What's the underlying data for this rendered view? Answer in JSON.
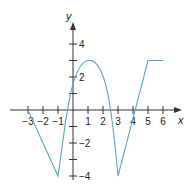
{
  "chart_data": {
    "type": "line",
    "title": "",
    "xlabel": "x",
    "ylabel": "y",
    "xlim": [
      -3.5,
      6.5
    ],
    "ylim": [
      -4.5,
      5
    ],
    "grid": false,
    "x_ticks": [
      -3,
      -2,
      -1,
      1,
      2,
      3,
      4,
      5,
      6
    ],
    "x_tick_labels": [
      "−3",
      "−2",
      "−1",
      "1",
      "2",
      "3",
      "4",
      "5",
      "6"
    ],
    "y_ticks": [
      -4,
      -3,
      -2,
      -1,
      1,
      2,
      3,
      4
    ],
    "y_tick_labels": {
      "4": "4",
      "2": "2",
      "-2": "−2",
      "-4": "−4"
    },
    "series": [
      {
        "name": "f(x)",
        "color": "#5aa6c8",
        "points": [
          {
            "x": -3,
            "y": 0
          },
          {
            "x": -1,
            "y": -4
          },
          {
            "x": 0,
            "y": 1.5
          },
          {
            "x": 1,
            "y": 3
          },
          {
            "x": 2,
            "y": 1.5
          },
          {
            "x": 3,
            "y": -4
          },
          {
            "x": 5,
            "y": 3
          },
          {
            "x": 6,
            "y": 3
          }
        ]
      }
    ]
  }
}
